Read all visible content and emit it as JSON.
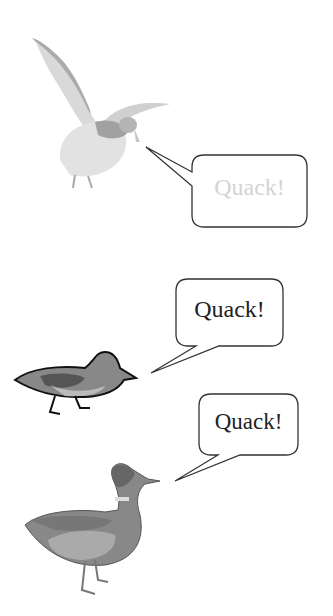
{
  "panels": [
    {
      "label": "Quack!",
      "text_color": "#d4d4d4",
      "duck": "flying-duck"
    },
    {
      "label": "Quack!",
      "text_color": "#222222",
      "duck": "walking-duck"
    },
    {
      "label": "Quack!",
      "text_color": "#222222",
      "duck": "standing-mallard"
    }
  ]
}
